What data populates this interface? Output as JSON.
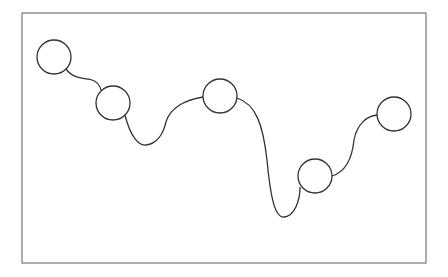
{
  "diagram": {
    "type": "node-chain",
    "frame": {
      "x": 22,
      "y": 13,
      "width": 404,
      "height": 250,
      "stroke": "#777777"
    },
    "stroke_color": "#333333",
    "node_fill": "#ffffff",
    "nodes": [
      {
        "id": "n1",
        "cx": 54,
        "cy": 57,
        "r": 17
      },
      {
        "id": "n2",
        "cx": 113,
        "cy": 103,
        "r": 17
      },
      {
        "id": "n3",
        "cx": 220,
        "cy": 96,
        "r": 17
      },
      {
        "id": "n4",
        "cx": 315,
        "cy": 176,
        "r": 17
      },
      {
        "id": "n5",
        "cx": 394,
        "cy": 114,
        "r": 17
      }
    ],
    "edges": [
      {
        "from": "n1",
        "to": "n2",
        "path": "M 66 69 C 74 80, 86 78, 92 80 C 98 82, 100 86, 101 90"
      },
      {
        "from": "n2",
        "to": "n3",
        "path": "M 125 115 C 130 135, 138 146, 146 145 C 156 144, 163 135, 166 122 C 170 108, 185 100, 203 97"
      },
      {
        "from": "n3",
        "to": "n4",
        "path": "M 237 98 C 256 104, 263 125, 267 160 C 270 192, 274 218, 284 217 C 295 216, 300 200, 300 187"
      },
      {
        "from": "n4",
        "to": "n5",
        "path": "M 332 176 C 345 172, 352 160, 354 140 C 357 124, 367 116, 377 115"
      }
    ]
  }
}
